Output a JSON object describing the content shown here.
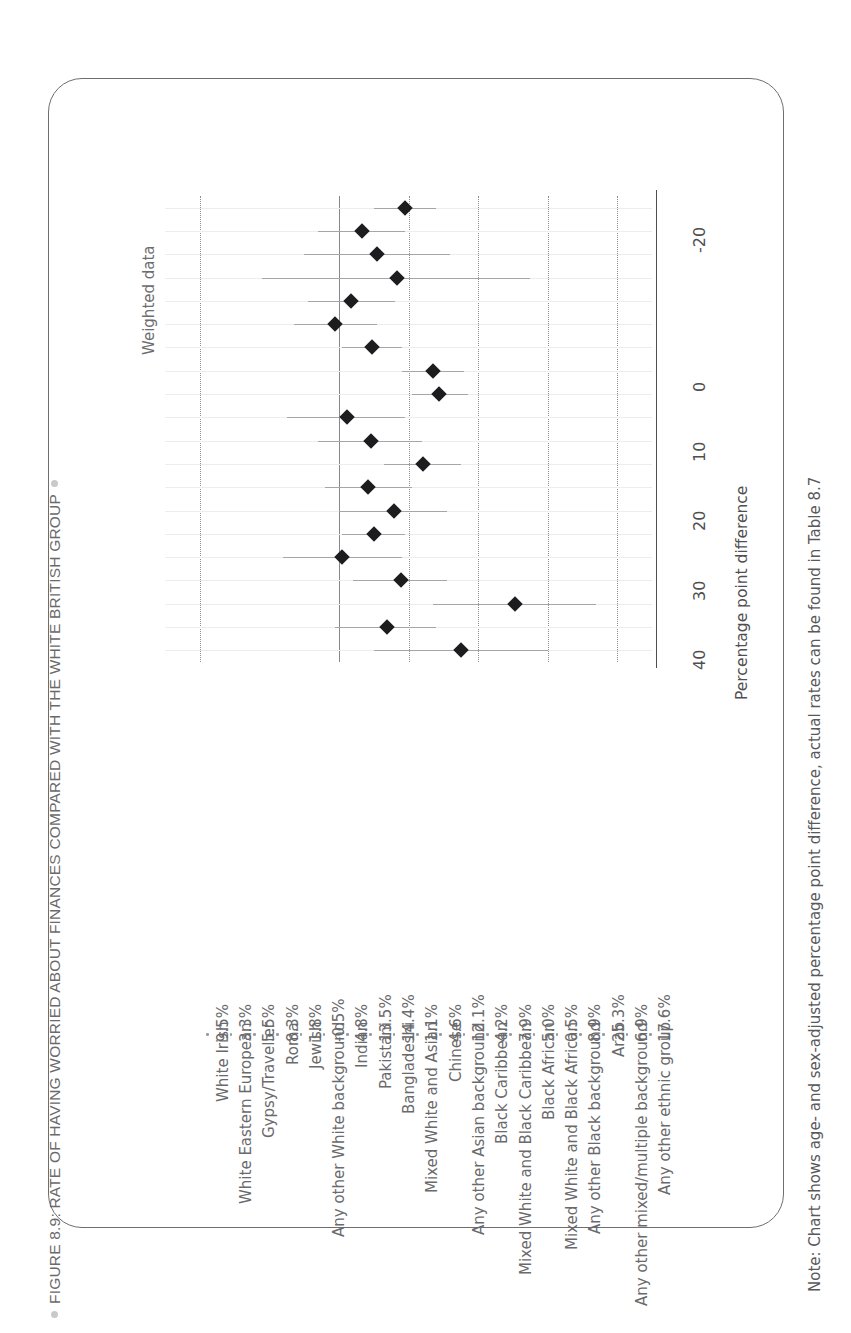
{
  "figure": {
    "title": "FIGURE 8.9: RATE OF HAVING WORRIED ABOUT FINANCES COMPARED WITH THE WHITE BRITISH GROUP",
    "note": "Note: Chart shows age- and sex-adjusted percentage point difference, actual rates can be found in Table 8.7",
    "panel_title": "Weighted data"
  },
  "chart_data": {
    "type": "scatter",
    "title": "FIGURE 8.9: RATE OF HAVING WORRIED ABOUT FINANCES COMPARED WITH THE WHITE BRITISH GROUP",
    "subtitle": "Weighted data",
    "xlabel": "Percentage point difference",
    "ylabel": "",
    "xlim": [
      -25,
      45
    ],
    "xticks": [
      -20,
      0,
      10,
      20,
      30,
      40
    ],
    "xticklabels": [
      "-20",
      "0",
      "10",
      "20",
      "30",
      "40"
    ],
    "grid": true,
    "gridlines_at": [
      -20,
      10,
      20,
      30,
      40
    ],
    "reference_line": 0,
    "legend": "none",
    "orientation": "horizontal-dot-plot-with-confidence-intervals",
    "categories": [
      "White Irish",
      "White Eastern European",
      "Gypsy/Traveller",
      "Roma",
      "Jewish",
      "Any other White background",
      "Indian",
      "Pakistani",
      "Bangladeshi",
      "Mixed White and Asian",
      "Chinese",
      "Any other Asian background",
      "Black Caribbean",
      "Mixed White and Black Caribbean",
      "Black African",
      "Mixed White and Black African",
      "Any other Black background",
      "Arab",
      "Any other mixed/multiple background",
      "Any other ethnic group"
    ],
    "value_labels": [
      "9.5%",
      "3.3%",
      "5.5%",
      "8.3%",
      "1.8%",
      "-0.5%",
      "4.8%",
      "13.5%",
      "14.4%",
      "1.1%",
      "4.6%",
      "12.1%",
      "4.2%",
      "7.9%",
      "5.0%",
      "0.5%",
      "8.9%",
      "25.3%",
      "6.9%",
      "17.6%"
    ],
    "values": [
      9.5,
      3.3,
      5.5,
      8.3,
      1.8,
      -0.5,
      4.8,
      13.5,
      14.4,
      1.1,
      4.6,
      12.1,
      4.2,
      7.9,
      5.0,
      0.5,
      8.9,
      25.3,
      6.9,
      17.6
    ],
    "ci_low": [
      5.0,
      -3.0,
      -5.0,
      -11.0,
      -4.5,
      -6.5,
      0.5,
      9.0,
      10.5,
      -7.5,
      -3.0,
      6.5,
      -2.0,
      0.0,
      0.5,
      -8.0,
      2.0,
      13.5,
      -0.5,
      5.0
    ],
    "ci_high": [
      14.0,
      9.5,
      16.0,
      27.5,
      8.0,
      5.5,
      9.0,
      18.0,
      18.5,
      9.5,
      12.0,
      17.5,
      10.5,
      15.5,
      9.5,
      9.0,
      15.5,
      37.0,
      14.0,
      30.0
    ]
  },
  "axis": {
    "ticks": [
      "-20",
      "0",
      "10",
      "20",
      "30",
      "40"
    ],
    "title": "Percentage point difference"
  }
}
